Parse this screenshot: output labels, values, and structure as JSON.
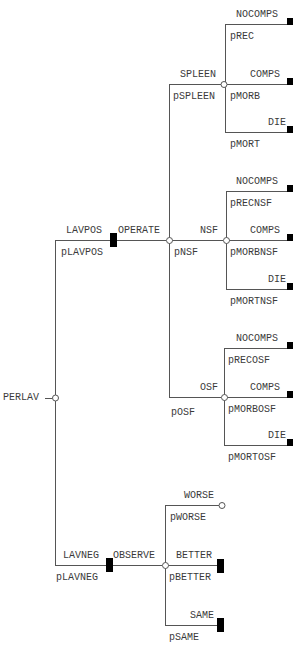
{
  "diagram": {
    "type": "decision-tree",
    "root": {
      "label": "PERLAV",
      "node_type": "chance",
      "branches": [
        {
          "label": "LAVPOS",
          "prob": "pLAVPOS",
          "node_type": "decision",
          "choice": {
            "label": "OPERATE",
            "node_type": "chance",
            "branches": [
              {
                "label": "SPLEEN",
                "prob": "pSPLEEN",
                "outcomes": [
                  {
                    "label": "NOCOMPS",
                    "prob": "pREC"
                  },
                  {
                    "label": "COMPS",
                    "prob": "pMORB"
                  },
                  {
                    "label": "DIE",
                    "prob": "pMORT"
                  }
                ]
              },
              {
                "label": "NSF",
                "prob": "pNSF",
                "outcomes": [
                  {
                    "label": "NOCOMPS",
                    "prob": "pRECNSF"
                  },
                  {
                    "label": "COMPS",
                    "prob": "pMORBNSF"
                  },
                  {
                    "label": "DIE",
                    "prob": "pMORTNSF"
                  }
                ]
              },
              {
                "label": "OSF",
                "prob": "pOSF",
                "outcomes": [
                  {
                    "label": "NOCOMPS",
                    "prob": "pRECOSF"
                  },
                  {
                    "label": "COMPS",
                    "prob": "pMORBOSF"
                  },
                  {
                    "label": "DIE",
                    "prob": "pMORTOSF"
                  }
                ]
              }
            ]
          }
        },
        {
          "label": "LAVNEG",
          "prob": "pLAVNEG",
          "node_type": "decision",
          "choice": {
            "label": "OBSERVE",
            "node_type": "chance",
            "outcomes": [
              {
                "label": "WORSE",
                "prob": "pWORSE",
                "end": "chance"
              },
              {
                "label": "BETTER",
                "prob": "pBETTER",
                "end": "terminal"
              },
              {
                "label": "SAME",
                "prob": "pSAME",
                "end": "terminal"
              }
            ]
          }
        }
      ]
    }
  },
  "colors": {
    "line": "#555555",
    "terminal": "#000000",
    "text": "#3a3a3a"
  }
}
